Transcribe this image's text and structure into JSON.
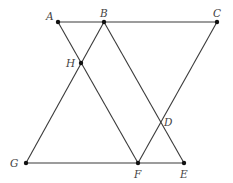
{
  "diagram": {
    "points": {
      "A": {
        "label": "A",
        "x": 58,
        "y": 22,
        "dot": true
      },
      "B": {
        "label": "B",
        "x": 104,
        "y": 22,
        "dot": true
      },
      "C": {
        "label": "C",
        "x": 217,
        "y": 22,
        "dot": true
      },
      "H": {
        "label": "H",
        "x": 81,
        "y": 63,
        "dot": true
      },
      "D": {
        "label": "D",
        "x": 159,
        "y": 124,
        "dot": false
      },
      "G": {
        "label": "G",
        "x": 26,
        "y": 163,
        "dot": true
      },
      "F": {
        "label": "F",
        "x": 138,
        "y": 163,
        "dot": true
      },
      "E": {
        "label": "E",
        "x": 184,
        "y": 163,
        "dot": true
      }
    },
    "segments": [
      {
        "name": "AC",
        "from": "A",
        "to": "C"
      },
      {
        "name": "GE",
        "from": "G",
        "to": "E"
      },
      {
        "name": "AF",
        "from": "A",
        "to": "F"
      },
      {
        "name": "BG",
        "from": "B",
        "to": "G"
      },
      {
        "name": "BE",
        "from": "B",
        "to": "E"
      },
      {
        "name": "CF",
        "from": "C",
        "to": "F"
      }
    ]
  }
}
